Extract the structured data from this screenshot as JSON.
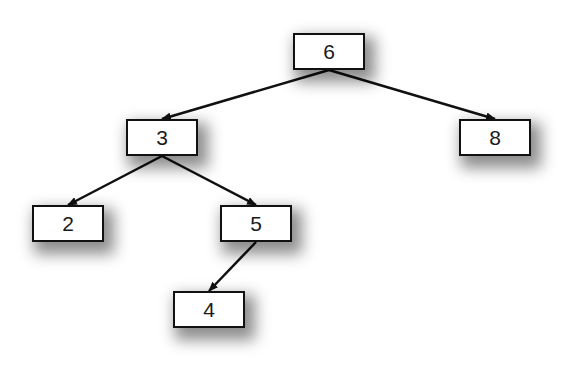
{
  "diagram": {
    "type": "binary-search-tree",
    "colors": {
      "background": "#ffffff",
      "node_fill": "#ffffff",
      "node_border": "#111111",
      "edge": "#111111",
      "text": "#1a1a1a"
    },
    "node_size": {
      "width": 72,
      "height": 37
    },
    "nodes": [
      {
        "id": "n6",
        "label": "6",
        "x": 293,
        "y": 33
      },
      {
        "id": "n3",
        "label": "3",
        "x": 126,
        "y": 119
      },
      {
        "id": "n8",
        "label": "8",
        "x": 459,
        "y": 119
      },
      {
        "id": "n2",
        "label": "2",
        "x": 32,
        "y": 205
      },
      {
        "id": "n5",
        "label": "5",
        "x": 220,
        "y": 205
      },
      {
        "id": "n4",
        "label": "4",
        "x": 173,
        "y": 291
      }
    ],
    "edges": [
      {
        "from": "n6",
        "to": "n3"
      },
      {
        "from": "n6",
        "to": "n8"
      },
      {
        "from": "n3",
        "to": "n2"
      },
      {
        "from": "n3",
        "to": "n5"
      },
      {
        "from": "n5",
        "to": "n4"
      }
    ]
  }
}
